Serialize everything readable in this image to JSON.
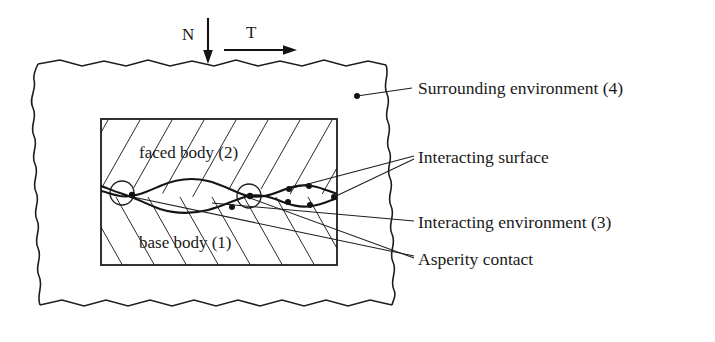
{
  "figure": {
    "type": "schematic-diagram"
  },
  "forces": {
    "normal_label": "N",
    "tangential_label": "T"
  },
  "bodies": {
    "upper_label": "faced body (2)",
    "lower_label": "base body (1)"
  },
  "callouts": {
    "surrounding_environment": "Surrounding environment (4)",
    "interacting_surface": "Interacting surface",
    "interacting_environment": "Interacting environment (3)",
    "asperity_contact": "Asperity contact"
  },
  "colors": {
    "ink": "#1d1d1d",
    "background": "#ffffff"
  }
}
